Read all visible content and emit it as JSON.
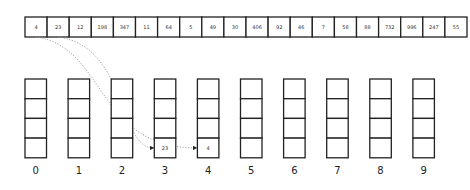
{
  "input_array": [
    "4",
    "23",
    "12",
    "198",
    "347",
    "11",
    "64",
    "5",
    "49",
    "30",
    "406",
    "92",
    "46",
    "7",
    "58",
    "88",
    "732",
    "996",
    "247",
    "55"
  ],
  "buckets": [
    {
      "label": "0",
      "items": []
    },
    {
      "label": "1",
      "items": []
    },
    {
      "label": "2",
      "items": []
    },
    {
      "label": "3",
      "items": [
        "23"
      ]
    },
    {
      "label": "4",
      "items": [
        "4"
      ]
    },
    {
      "label": "5",
      "items": []
    },
    {
      "label": "6",
      "items": []
    },
    {
      "label": "7",
      "items": []
    },
    {
      "label": "8",
      "items": []
    },
    {
      "label": "9",
      "items": []
    }
  ],
  "arrows": [
    {
      "from_index": 0,
      "to_bucket": 4
    },
    {
      "from_index": 1,
      "to_bucket": 3
    }
  ],
  "colors": {
    "stroke": "#222222",
    "arrow": "#999999",
    "background": "#ffffff"
  }
}
